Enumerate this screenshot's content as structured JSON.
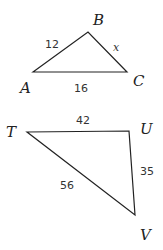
{
  "triangles": [
    {
      "name": "ABC",
      "vertices": {
        "A": "A",
        "B": "B",
        "C": "C"
      },
      "sides": {
        "AB": "12",
        "BC": "x",
        "AC": "16"
      }
    },
    {
      "name": "TUV",
      "vertices": {
        "T": "T",
        "U": "U",
        "V": "V"
      },
      "sides": {
        "TU": "42",
        "UV": "35",
        "TV": "56"
      }
    }
  ]
}
